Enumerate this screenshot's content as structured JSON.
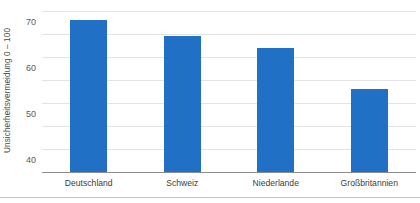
{
  "chart_data": {
    "type": "bar",
    "title": "",
    "xlabel": "",
    "ylabel": "Unsicherheitsvermeidung  0 – 100",
    "categories": [
      "Deutschland",
      "Schweiz",
      "Niederlande",
      "Großbritannien"
    ],
    "values": [
      66,
      59,
      54,
      36
    ],
    "series": [
      {
        "name": "Unsicherheitsvermeidung",
        "values": [
          66,
          59,
          54,
          36
        ]
      }
    ],
    "ylim": [
      0,
      70
    ],
    "ytick_labels": [
      "0",
      "10",
      "20",
      "30",
      "40",
      "50",
      "60",
      "70"
    ],
    "ytick_values": [
      0,
      10,
      20,
      30,
      40,
      50,
      60,
      70
    ],
    "grid": true,
    "legend": false,
    "legend_position": "none",
    "bar_color": "#2070c5",
    "gridline_color": "#e3e3e3",
    "baseline_color": "#8c8c8c",
    "background_color": "#ffffff",
    "annotations": []
  }
}
